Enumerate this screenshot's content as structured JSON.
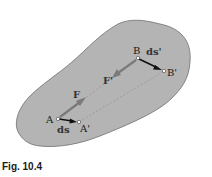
{
  "figure": {
    "caption": "Fig. 10.4",
    "colors": {
      "body_fill": "#b4b4b4",
      "body_outline": "#6e6e6e",
      "force_arrow": "#7a7a7a",
      "displacement_arrow": "#111111",
      "dashed_line": "#8a8a8a",
      "point_fill": "#ffffff"
    },
    "points": {
      "A": {
        "label": "A",
        "x": 58,
        "y": 119
      },
      "A_prime": {
        "label": "A'",
        "x": 79,
        "y": 122
      },
      "B": {
        "label": "B",
        "x": 138,
        "y": 58
      },
      "B_prime": {
        "label": "B'",
        "x": 164,
        "y": 71
      }
    },
    "vectors": {
      "F": {
        "label": "F"
      },
      "F_prime": {
        "label": "F'"
      },
      "ds": {
        "label": "ds"
      },
      "ds_prime": {
        "label": "ds'"
      }
    }
  }
}
